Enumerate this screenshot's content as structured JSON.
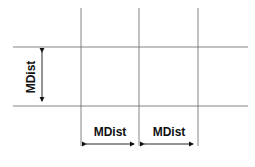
{
  "diagram": {
    "vertical_label": "MDist",
    "horizontal_labels": [
      "MDist",
      "MDist"
    ],
    "caption": "",
    "grid": {
      "vertical_lines_x": [
        81,
        139,
        198
      ],
      "horizontal_lines_y": [
        47,
        106
      ],
      "line_color": "#555555"
    },
    "arrow_color": "#111111"
  }
}
